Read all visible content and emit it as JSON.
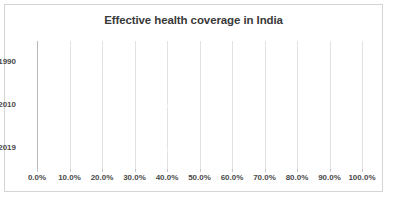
{
  "chart_data": {
    "type": "bar",
    "orientation": "horizontal",
    "title": "Effective health coverage in India",
    "xlabel": "",
    "ylabel": "",
    "categories": [
      "1990",
      "2010",
      "2019"
    ],
    "values": [
      26.9,
      42.1,
      46.8
    ],
    "data_labels": [
      "26.9%",
      "42.1%",
      "46.8%"
    ],
    "xlim": [
      0,
      100
    ],
    "xticks": [
      0,
      10,
      20,
      30,
      40,
      50,
      60,
      70,
      80,
      90,
      100
    ],
    "xtick_labels": [
      "0.0%",
      "10.0%",
      "20.0%",
      "30.0%",
      "40.0%",
      "50.0%",
      "60.0%",
      "70.0%",
      "80.0%",
      "90.0%",
      "100.0%"
    ],
    "grid": "vertical",
    "legend": "none",
    "bar_color": "#595959",
    "gridline_color": "#e2e2e2",
    "title_color": "#3a3a3a",
    "label_color": "#4a4a4a",
    "data_label_color": "#ffffff",
    "border_color": "#d4d4d4",
    "background_color": "#ffffff"
  }
}
